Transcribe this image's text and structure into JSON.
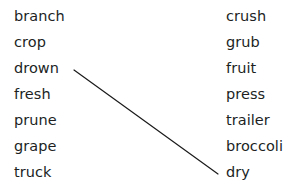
{
  "background_color": "#ffffff",
  "text_color": "#211f1f",
  "line_color": "#1a1a1a",
  "matching_exercise": {
    "left_column": {
      "items": [
        {
          "label": "branch"
        },
        {
          "label": "crop"
        },
        {
          "label": "drown"
        },
        {
          "label": "fresh"
        },
        {
          "label": "prune"
        },
        {
          "label": "grape"
        },
        {
          "label": "truck"
        }
      ]
    },
    "right_column": {
      "items": [
        {
          "label": "crush"
        },
        {
          "label": "grub"
        },
        {
          "label": "fruit"
        },
        {
          "label": "press"
        },
        {
          "label": "trailer"
        },
        {
          "label": "broccoli"
        },
        {
          "label": "dry"
        }
      ]
    },
    "connections": [
      {
        "from": "drown",
        "to": "dry",
        "x1": 74,
        "y1": 70,
        "x2": 218,
        "y2": 174
      }
    ]
  }
}
